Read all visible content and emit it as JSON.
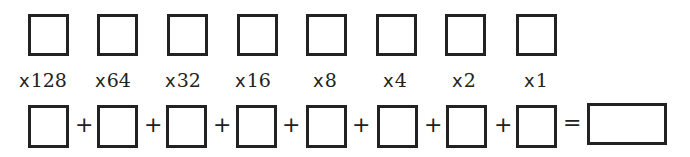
{
  "diagram": {
    "place_values": [
      {
        "label": "x128",
        "multiplier": 128
      },
      {
        "label": "x64",
        "multiplier": 64
      },
      {
        "label": "x32",
        "multiplier": 32
      },
      {
        "label": "x16",
        "multiplier": 16
      },
      {
        "label": "x8",
        "multiplier": 8
      },
      {
        "label": "x4",
        "multiplier": 4
      },
      {
        "label": "x2",
        "multiplier": 2
      },
      {
        "label": "x1",
        "multiplier": 1
      }
    ],
    "labels": {
      "l0": {
        "x": "x",
        "n": "128"
      },
      "l1": {
        "x": "x",
        "n": "64"
      },
      "l2": {
        "x": "x",
        "n": "32"
      },
      "l3": {
        "x": "x",
        "n": "16"
      },
      "l4": {
        "x": "x",
        "n": "8"
      },
      "l5": {
        "x": "x",
        "n": "4"
      },
      "l6": {
        "x": "x",
        "n": "2"
      },
      "l7": {
        "x": "x",
        "n": "1"
      }
    },
    "operators": {
      "plus": "+",
      "equals": "="
    },
    "bit_boxes_count": 8,
    "product_boxes_count": 8,
    "result_box": ""
  }
}
